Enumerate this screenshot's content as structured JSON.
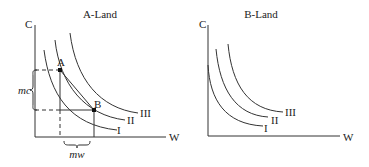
{
  "panels": [
    {
      "title": "A-Land",
      "y_axis_label": "C",
      "x_axis_label": "W",
      "curves": [
        "I",
        "II",
        "III"
      ],
      "points": [
        "A",
        "B"
      ],
      "brace_vertical_label": "mc",
      "brace_horizontal_label": "mw"
    },
    {
      "title": "B-Land",
      "y_axis_label": "C",
      "x_axis_label": "W",
      "curves": [
        "I",
        "II",
        "III"
      ]
    }
  ],
  "colors": {
    "line": "#333333",
    "text": "#222222",
    "background": "#ffffff"
  }
}
